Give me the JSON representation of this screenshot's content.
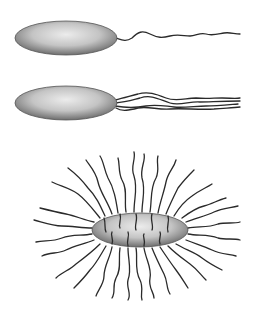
{
  "diagram": {
    "type": "bacterial-flagella-arrangements",
    "background": "#ffffff",
    "cell_fill_light": "#e6e6e6",
    "cell_fill_dark": "#7a7a7a",
    "flagellum_color": "#2a2a2a",
    "cells": [
      {
        "name": "monotrichous",
        "flagella_count": 1,
        "position": "polar"
      },
      {
        "name": "lophotrichous",
        "flagella_count": 4,
        "position": "polar-tuft"
      },
      {
        "name": "peritrichous",
        "flagella_count": 40,
        "position": "all-around"
      }
    ]
  }
}
